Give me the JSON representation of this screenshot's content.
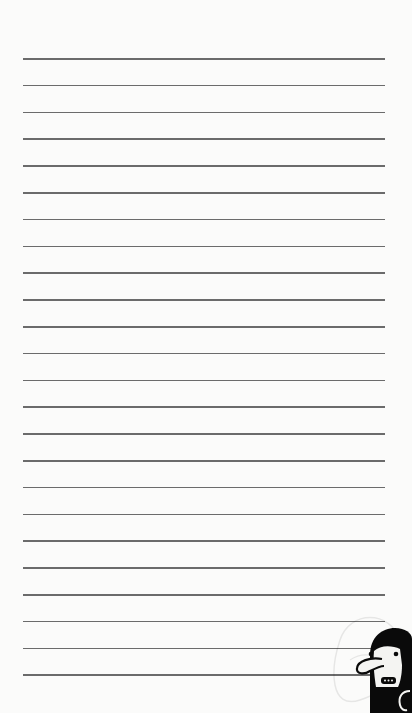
{
  "page": {
    "type": "lined-notebook-paper",
    "background_color": "#fbfbfa",
    "line_color": "#6b6b6b",
    "line_count": 24,
    "first_line_y": 58,
    "line_spacing": 26.8,
    "line_left": 23,
    "line_width": 362
  },
  "decoration": {
    "character_icon": "hooded-cartoon-character-icon",
    "hood_color": "#0a0a0a",
    "face_color": "#f4f4f2"
  }
}
